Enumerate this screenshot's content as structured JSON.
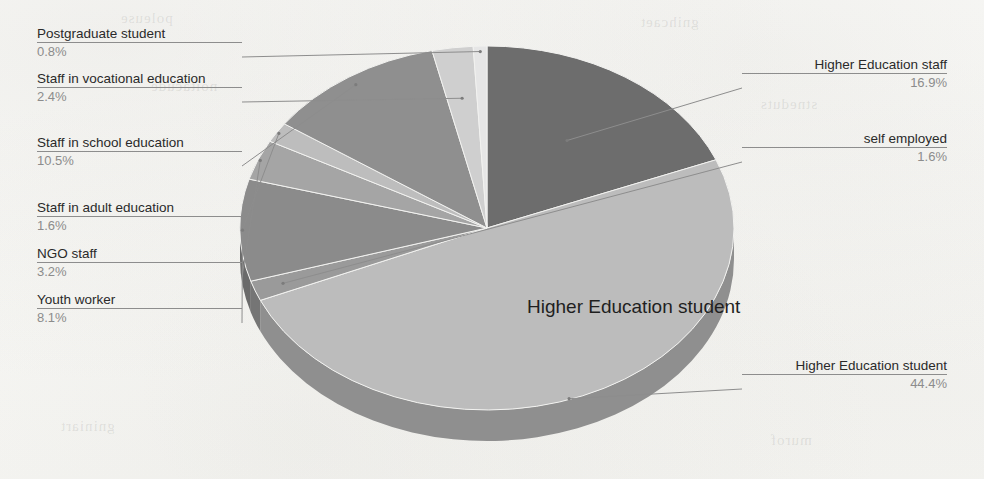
{
  "chart_data": {
    "type": "pie",
    "title": "",
    "center_label": "Higher Education student",
    "three_d": true,
    "start_angle_deg": 0,
    "direction": "clockwise",
    "legend_position": "callout-labels",
    "grid": false,
    "unit": "%",
    "categories": [
      "Higher Education staff",
      "Higher Education student",
      "self employed",
      "Youth worker",
      "NGO staff",
      "Staff in adult education",
      "Staff in school education",
      "Staff in vocational education",
      "Postgraduate student"
    ],
    "values": [
      16.9,
      44.4,
      1.6,
      8.1,
      3.2,
      1.6,
      10.5,
      2.4,
      0.8
    ],
    "value_labels": [
      "16.9%",
      "44.4%",
      "1.6%",
      "8.1%",
      "3.2%",
      "1.6%",
      "10.5%",
      "2.4%",
      "0.8%"
    ],
    "colors": [
      "#6d6d6d",
      "#bcbcbc",
      "#9a9a9a",
      "#8b8b8b",
      "#a5a5a5",
      "#bdbdbd",
      "#8f8f8f",
      "#cfcfcf",
      "#e6e6e6"
    ],
    "side_colors": [
      "#4f4f4f",
      "#8f8f8f",
      "#757575",
      "#6a6a6a",
      "#7d7d7d",
      "#909090",
      "#6d6d6d",
      "#a0a0a0",
      "#b4b4b4"
    ]
  },
  "callouts": {
    "postgraduate_student": {
      "label": "Postgraduate student",
      "value": "0.8%"
    },
    "staff_vocational_education": {
      "label": "Staff in vocational education",
      "value": "2.4%"
    },
    "staff_school_education": {
      "label": "Staff in school education",
      "value": "10.5%"
    },
    "staff_adult_education": {
      "label": "Staff in adult education",
      "value": "1.6%"
    },
    "ngo_staff": {
      "label": "NGO staff",
      "value": "3.2%"
    },
    "youth_worker": {
      "label": "Youth worker",
      "value": "8.1%"
    },
    "higher_education_staff": {
      "label": "Higher Education staff",
      "value": "16.9%"
    },
    "self_employed": {
      "label": "self employed",
      "value": "1.6%"
    },
    "higher_education_student": {
      "label": "Higher Education student",
      "value": "44.4%"
    }
  },
  "bleed_text": {
    "a": "poleuse",
    "b": "gnihcaet",
    "c": "noitacude",
    "d": "stneduts",
    "e": "gniniart",
    "f": "murof"
  },
  "colors": {
    "background": "#fbfbf9",
    "label_text": "#2a2a2a",
    "value_text": "#8c8c8c",
    "leader_line": "#8d8d8d"
  }
}
